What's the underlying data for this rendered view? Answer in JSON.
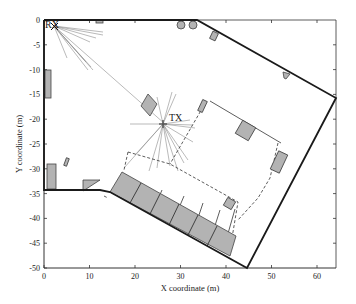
{
  "figure": {
    "type": "floor-plan ray-tracing diagram",
    "xlabel": "X coordinate (m)",
    "ylabel": "Y coordinate (m)",
    "xlim": [
      0,
      64
    ],
    "ylim": [
      -51,
      0
    ],
    "xticks": [
      "0",
      "10",
      "20",
      "30",
      "40",
      "50",
      "60"
    ],
    "yticks": [
      "0",
      "-5",
      "-10",
      "-15",
      "-20",
      "-25",
      "-30",
      "-35",
      "-40",
      "-45",
      "-50"
    ],
    "colors": {
      "wall": "#1a1a1a",
      "obstacle_fill": "#b3b3b3",
      "obstacle_stroke": "#444444",
      "ray": "#8c8c8c",
      "dashed_zone": "#333333"
    }
  },
  "markers": {
    "rx": {
      "label": "RX",
      "x": 1.5,
      "y": -0.8
    },
    "tx": {
      "label": "TX",
      "x": 28.5,
      "y": -21.5
    }
  }
}
